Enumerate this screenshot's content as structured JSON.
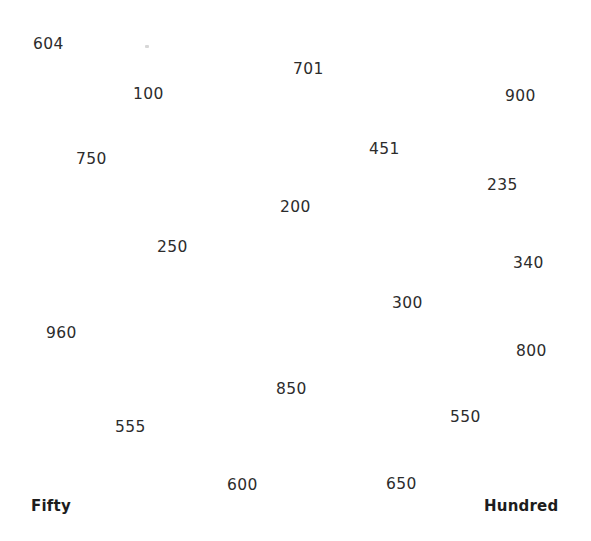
{
  "page": {
    "background_color": "#ffffff",
    "text_color": "#2c2c2c",
    "anchor_color": "#1d1d1d",
    "width": 591,
    "height": 541
  },
  "anchors": [
    {
      "label": "Fifty",
      "x": 31,
      "y": 499
    },
    {
      "label": "Hundred",
      "x": 484,
      "y": 499
    }
  ],
  "numbers": [
    {
      "value": "604",
      "x": 33,
      "y": 37
    },
    {
      "value": "701",
      "x": 293,
      "y": 62
    },
    {
      "value": "100",
      "x": 133,
      "y": 87
    },
    {
      "value": "900",
      "x": 505,
      "y": 89
    },
    {
      "value": "451",
      "x": 369,
      "y": 142
    },
    {
      "value": "750",
      "x": 76,
      "y": 152
    },
    {
      "value": "235",
      "x": 487,
      "y": 178
    },
    {
      "value": "200",
      "x": 280,
      "y": 200
    },
    {
      "value": "250",
      "x": 157,
      "y": 240
    },
    {
      "value": "340",
      "x": 513,
      "y": 256
    },
    {
      "value": "300",
      "x": 392,
      "y": 296
    },
    {
      "value": "960",
      "x": 46,
      "y": 326
    },
    {
      "value": "800",
      "x": 516,
      "y": 344
    },
    {
      "value": "850",
      "x": 276,
      "y": 382
    },
    {
      "value": "550",
      "x": 450,
      "y": 410
    },
    {
      "value": "555",
      "x": 115,
      "y": 420
    },
    {
      "value": "600",
      "x": 227,
      "y": 478
    },
    {
      "value": "650",
      "x": 386,
      "y": 477
    },
    {
      "value": "450",
      "x": -999,
      "y": -999
    },
    {
      "value": "401",
      "x": -999,
      "y": -999
    }
  ],
  "artifacts": [
    {
      "name": "speck",
      "x": 145,
      "y": 45
    }
  ],
  "chart_data": {
    "type": "scatter",
    "title": "",
    "xlabel": "",
    "ylabel": "",
    "grid": false,
    "legend": null,
    "note": "Scattered number labels on a blank white sheet; each point is a text label positioned at the given pixel coordinates (origin top-left).",
    "xlim": [
      0,
      591
    ],
    "ylim": [
      0,
      541
    ],
    "points": [
      {
        "label": "604",
        "x": 33,
        "y": 37
      },
      {
        "label": "701",
        "x": 293,
        "y": 62
      },
      {
        "label": "100",
        "x": 133,
        "y": 87
      },
      {
        "label": "900",
        "x": 505,
        "y": 89
      },
      {
        "label": "451",
        "x": 369,
        "y": 142
      },
      {
        "label": "750",
        "x": 76,
        "y": 152
      },
      {
        "label": "235",
        "x": 487,
        "y": 178
      },
      {
        "label": "200",
        "x": 280,
        "y": 200
      },
      {
        "label": "250",
        "x": 157,
        "y": 240
      },
      {
        "label": "340",
        "x": 513,
        "y": 256
      },
      {
        "label": "300",
        "x": 392,
        "y": 296
      },
      {
        "label": "960",
        "x": 46,
        "y": 326
      },
      {
        "label": "800",
        "x": 516,
        "y": 344
      },
      {
        "label": "850",
        "x": 276,
        "y": 382
      },
      {
        "label": "550",
        "x": 450,
        "y": 410
      },
      {
        "label": "555",
        "x": 115,
        "y": 420
      },
      {
        "label": "600",
        "x": 227,
        "y": 478
      },
      {
        "label": "650",
        "x": 386,
        "y": 477
      },
      {
        "label": "Fifty",
        "x": 31,
        "y": 499
      },
      {
        "label": "Hundred",
        "x": 484,
        "y": 499
      }
    ]
  }
}
